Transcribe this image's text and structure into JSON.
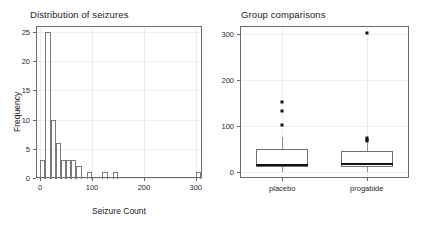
{
  "figure": {
    "width": 422,
    "height": 226,
    "background": "#ffffff"
  },
  "chart_data": [
    {
      "type": "bar",
      "chart_kind": "histogram",
      "title": "Distribution of seizures",
      "xlabel": "Seizure Count",
      "ylabel": "Frequency",
      "xlim": [
        -8,
        312
      ],
      "ylim": [
        0,
        26
      ],
      "xticks": [
        0,
        100,
        200,
        300
      ],
      "xtick_labels": [
        "0",
        "100",
        "200",
        "300"
      ],
      "yticks": [
        0,
        5,
        10,
        15,
        20,
        25
      ],
      "ytick_labels": [
        "0",
        "5",
        "10",
        "15",
        "20",
        "25"
      ],
      "grid": true,
      "legend": "none",
      "bin_width": 10,
      "bins": [
        {
          "x0": 0,
          "x1": 10,
          "count": 3
        },
        {
          "x0": 10,
          "x1": 20,
          "count": 25
        },
        {
          "x0": 20,
          "x1": 30,
          "count": 10
        },
        {
          "x0": 30,
          "x1": 40,
          "count": 6
        },
        {
          "x0": 40,
          "x1": 50,
          "count": 3
        },
        {
          "x0": 50,
          "x1": 60,
          "count": 3
        },
        {
          "x0": 60,
          "x1": 70,
          "count": 3
        },
        {
          "x0": 70,
          "x1": 80,
          "count": 2
        },
        {
          "x0": 80,
          "x1": 90,
          "count": 0
        },
        {
          "x0": 90,
          "x1": 100,
          "count": 1
        },
        {
          "x0": 100,
          "x1": 110,
          "count": 0
        },
        {
          "x0": 110,
          "x1": 120,
          "count": 0
        },
        {
          "x0": 120,
          "x1": 130,
          "count": 1
        },
        {
          "x0": 130,
          "x1": 140,
          "count": 0
        },
        {
          "x0": 140,
          "x1": 150,
          "count": 1
        },
        {
          "x0": 300,
          "x1": 310,
          "count": 1
        }
      ]
    },
    {
      "type": "boxplot",
      "title": "Group comparisons",
      "xlabel": "",
      "ylabel": "",
      "xlim": [
        0,
        2
      ],
      "ylim": [
        -14,
        318
      ],
      "yticks": [
        0,
        100,
        200,
        300
      ],
      "ytick_labels": [
        "0",
        "100",
        "200",
        "300"
      ],
      "xtick_labels": [
        "placebo",
        "progabide"
      ],
      "grid": true,
      "legend": "none",
      "boxes": [
        {
          "name": "placebo",
          "center": 0.5,
          "whisker_low": 0,
          "q1": 11,
          "median": 15,
          "q3": 50,
          "whisker_high": 76,
          "outliers": [
            102,
            133,
            151
          ]
        },
        {
          "name": "progabide",
          "center": 1.5,
          "whisker_low": 0,
          "q1": 9,
          "median": 16,
          "q3": 46,
          "whisker_high": 63,
          "outliers": [
            66,
            68,
            73,
            302
          ]
        }
      ]
    }
  ],
  "panels": {
    "histogram": {
      "title": "Distribution of seizures",
      "xlabel": "Seizure Count",
      "ylabel": "Frequency",
      "xtick_labels": [
        "0",
        "100",
        "200",
        "300"
      ],
      "ytick_labels": [
        "0",
        "5",
        "10",
        "15",
        "20",
        "25"
      ]
    },
    "boxplot": {
      "title": "Group comparisons",
      "ytick_labels": [
        "0",
        "100",
        "200",
        "300"
      ],
      "xtick_labels": [
        "placebo",
        "progabide"
      ]
    }
  },
  "colors": {
    "frame": "#6b6b6b",
    "grid": "#ededed",
    "bar_outline": "#7a7a7a",
    "median": "#111111",
    "outlier": "#111111",
    "whisker": "#8e8e8e",
    "text": "#1d1d1d",
    "background": "#ffffff"
  }
}
